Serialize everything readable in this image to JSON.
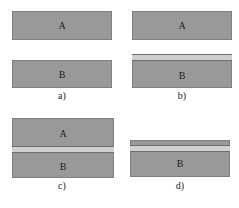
{
  "panels": [
    {
      "id": "a",
      "caption": "a)",
      "block_a": "A",
      "block_b": "B"
    },
    {
      "id": "b",
      "caption": "b)",
      "block_a": "A",
      "block_b": "B"
    },
    {
      "id": "c",
      "caption": "c)",
      "block_a": "A",
      "block_b": "B"
    },
    {
      "id": "d",
      "caption": "d)",
      "block_b": "B"
    }
  ],
  "colors": {
    "block": "#999999",
    "film": "#cfcfcf",
    "edge": "#6f6f6f"
  }
}
